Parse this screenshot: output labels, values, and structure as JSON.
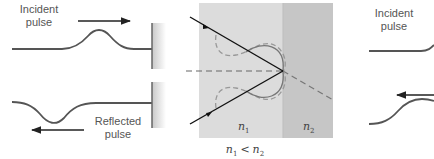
{
  "left_panel": {
    "incident_label": [
      "Incident",
      "pulse"
    ],
    "reflected_label": [
      "Reflected",
      "pulse"
    ]
  },
  "center_panel": {
    "medium1_label": "n",
    "medium1_sub": "1",
    "medium2_label": "n",
    "medium2_sub": "2",
    "relation": {
      "a": "n",
      "a_sub": "1",
      "op": "<",
      "b": "n",
      "b_sub": "2"
    },
    "colors": {
      "medium1": "#dcdcdc",
      "medium2": "#c6c6c6",
      "boundary_edge": "#b8b8b8"
    }
  },
  "right_panel": {
    "incident_label": [
      "Incident",
      "pulse"
    ]
  }
}
